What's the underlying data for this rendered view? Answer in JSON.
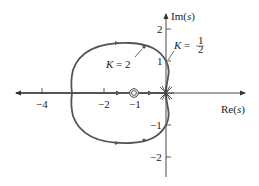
{
  "figure": {
    "type": "root-locus",
    "axes": {
      "x_label_prefix": "Re(",
      "x_label_var": "s",
      "x_label_suffix": ")",
      "y_label_prefix": "Im(",
      "y_label_var": "s",
      "y_label_suffix": ")",
      "x_ticks": [
        {
          "value": -4,
          "label": "−4"
        },
        {
          "value": -2,
          "label": "−2"
        },
        {
          "value": -1,
          "label": "−1"
        }
      ],
      "y_ticks": [
        {
          "value": 2,
          "label": "2"
        },
        {
          "value": 1,
          "label": "1"
        },
        {
          "value": -1,
          "label": "−1"
        },
        {
          "value": -2,
          "label": "−2"
        }
      ],
      "x_range": [
        -5,
        2
      ],
      "y_range": [
        -2.6,
        2.9
      ]
    },
    "zeros": [
      {
        "re": -1,
        "im": 0,
        "multiplicity": 2
      }
    ],
    "poles": [
      {
        "re": 0,
        "im": 0,
        "multiplicity": 3
      }
    ],
    "annotations": [
      {
        "text_k": "K",
        "text_eq": " = ",
        "text_val": "2",
        "point": {
          "re": -0.6,
          "im": 1.45
        }
      },
      {
        "text_k": "K",
        "text_eq": " = ",
        "num": "1",
        "den": "2",
        "point": {
          "re": 0,
          "im": 1
        }
      }
    ],
    "colors": {
      "locus": "#555555",
      "axis": "#333333",
      "text": "#222222"
    }
  }
}
